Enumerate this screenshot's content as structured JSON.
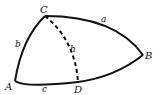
{
  "diagram": {
    "type": "spherical-triangle",
    "vertices": {
      "A": {
        "label": "A"
      },
      "B": {
        "label": "B"
      },
      "C": {
        "label": "C"
      },
      "D": {
        "label": "D"
      }
    },
    "sides": {
      "a": {
        "label": "a"
      },
      "b": {
        "label": "b"
      },
      "c": {
        "label": "c"
      },
      "h": {
        "label": "h",
        "style": "dashed"
      }
    },
    "colors": {
      "stroke": "#111111",
      "background": "#ffffff"
    }
  }
}
